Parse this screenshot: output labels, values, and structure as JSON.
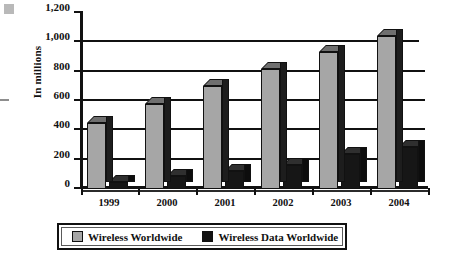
{
  "chart_data": {
    "type": "bar",
    "title": "",
    "xlabel": "",
    "ylabel": "In millions",
    "ylim": [
      0,
      1200
    ],
    "ytick_values": [
      0,
      200,
      400,
      600,
      800,
      1000,
      1200
    ],
    "ytick_labels": [
      "0",
      "200",
      "400",
      "600",
      "800",
      "1,000",
      "1,200"
    ],
    "grid": true,
    "legend_position": "bottom",
    "categories": [
      "1999",
      "2000",
      "2001",
      "2002",
      "2003",
      "2004"
    ],
    "series": [
      {
        "name": "Wireless Worldwide",
        "color": "#a6a6a6",
        "values": [
          450,
          580,
          700,
          820,
          935,
          1040
        ]
      },
      {
        "name": "Wireless Data Worldwide",
        "color": "#161616",
        "values": [
          50,
          90,
          125,
          165,
          240,
          285
        ]
      }
    ]
  },
  "axis": {
    "y_title": "In millions"
  },
  "legend": {
    "items": [
      {
        "label": "Wireless Worldwide",
        "swatch": "light"
      },
      {
        "label": "Wireless Data Worldwide",
        "swatch": "dark"
      }
    ]
  }
}
